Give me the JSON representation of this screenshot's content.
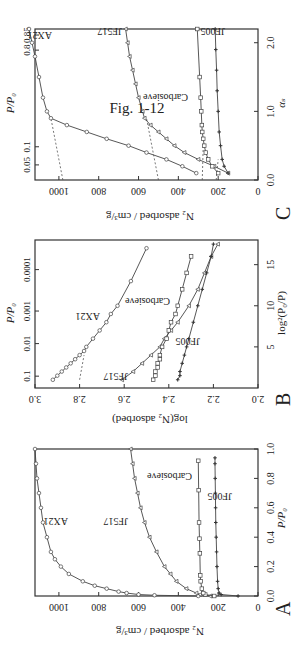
{
  "figure_caption_overlay": "Fig. 1-12",
  "chart_data": [
    {
      "panel": "A",
      "type": "line",
      "title": "",
      "xlabel": "P/P0",
      "ylabel": "N2 adsorbed / cm3/g",
      "xlim": [
        0.0,
        1.0
      ],
      "ylim": [
        0,
        1120
      ],
      "xticks": [
        "0.0",
        "0.2",
        "0.4",
        "0.6",
        "0.8",
        "1.0"
      ],
      "yticks": [
        "0",
        "200",
        "400",
        "600",
        "800",
        "1000"
      ],
      "grid": false,
      "series": [
        {
          "name": "AX21",
          "marker": "circle",
          "x": [
            0.0,
            0.005,
            0.01,
            0.02,
            0.03,
            0.05,
            0.07,
            0.1,
            0.15,
            0.2,
            0.25,
            0.3,
            0.4,
            0.5,
            0.6,
            0.7,
            0.8,
            0.9,
            1.0
          ],
          "y": [
            300,
            520,
            600,
            660,
            700,
            760,
            820,
            880,
            950,
            990,
            1020,
            1040,
            1060,
            1080,
            1090,
            1100,
            1110,
            1115,
            1120
          ]
        },
        {
          "name": "JF517",
          "marker": "triangle",
          "x": [
            0.0,
            0.01,
            0.02,
            0.05,
            0.1,
            0.15,
            0.2,
            0.3,
            0.4,
            0.5,
            0.6,
            0.7,
            0.8,
            0.9,
            1.0
          ],
          "y": [
            240,
            290,
            310,
            360,
            410,
            440,
            470,
            510,
            545,
            570,
            590,
            605,
            620,
            630,
            640
          ]
        },
        {
          "name": "Carbosieve",
          "marker": "square",
          "x": [
            0.0,
            0.01,
            0.02,
            0.05,
            0.1,
            0.14,
            0.29,
            0.39,
            0.5,
            0.72,
            0.92
          ],
          "y": [
            220,
            265,
            275,
            282,
            288,
            290,
            292,
            294,
            296,
            298,
            300
          ]
        },
        {
          "name": "JF005",
          "marker": "plus",
          "x": [
            0.0,
            0.01,
            0.02,
            0.05,
            0.1,
            0.2,
            0.3,
            0.4,
            0.5,
            0.6,
            0.7,
            0.8,
            0.9,
            0.94
          ],
          "y": [
            100,
            185,
            195,
            200,
            203,
            206,
            208,
            210,
            212,
            213,
            214,
            215,
            216,
            216
          ]
        }
      ],
      "labels": [
        "AX21",
        "JF517",
        "Carbosieve",
        "JF005"
      ]
    },
    {
      "panel": "B",
      "type": "line",
      "xlabel": "log2(P0/P)",
      "ylabel": "log(N2 adsorbed)",
      "top_axis_label": "P/P0",
      "top_ticks": [
        "0.1",
        "0.01",
        "0.001",
        "0.0001"
      ],
      "xlim": [
        0,
        18
      ],
      "ylim": [
        2.0,
        3.0
      ],
      "xticks": [
        "5",
        "10",
        "15"
      ],
      "yticks": [
        "2.0",
        "2.2",
        "2.4",
        "2.6",
        "2.8",
        "3.0"
      ],
      "series": [
        {
          "name": "AX21",
          "x": [
            1,
            1.5,
            2,
            2.5,
            3,
            3.5,
            4,
            4.5,
            5,
            6,
            7,
            8,
            9,
            10,
            13,
            17
          ],
          "y": [
            2.92,
            2.9,
            2.88,
            2.86,
            2.84,
            2.82,
            2.8,
            2.78,
            2.77,
            2.74,
            2.71,
            2.68,
            2.66,
            2.63,
            2.57,
            2.5
          ],
          "dashed_extrap": {
            "x": [
              1,
              4
            ],
            "y": [
              2.8,
              2.78
            ]
          }
        },
        {
          "name": "JF517",
          "x": [
            1,
            2,
            3,
            4,
            5,
            6,
            7,
            8,
            10,
            12,
            14,
            16,
            17.5
          ],
          "y": [
            2.61,
            2.56,
            2.52,
            2.48,
            2.44,
            2.42,
            2.39,
            2.36,
            2.31,
            2.27,
            2.24,
            2.21,
            2.18
          ]
        },
        {
          "name": "Carbosieve",
          "x": [
            1,
            1.5,
            2,
            2.5,
            3,
            3.5,
            4,
            5,
            6,
            7,
            8,
            9,
            10,
            12,
            14,
            16
          ],
          "y": [
            2.47,
            2.46,
            2.46,
            2.45,
            2.45,
            2.44,
            2.44,
            2.43,
            2.41,
            2.4,
            2.39,
            2.37,
            2.36,
            2.34,
            2.32,
            2.3
          ]
        },
        {
          "name": "JF005",
          "x": [
            1,
            1.5,
            2,
            3,
            4,
            5,
            6,
            8,
            10,
            12,
            14,
            16,
            17.5
          ],
          "y": [
            2.36,
            2.35,
            2.35,
            2.34,
            2.33,
            2.32,
            2.31,
            2.29,
            2.27,
            2.25,
            2.23,
            2.21,
            2.2
          ]
        }
      ],
      "labels": [
        "AX21",
        "JF517",
        "Carbosieve",
        "JF005"
      ]
    },
    {
      "panel": "C",
      "type": "line",
      "xlabel": "αs",
      "ylabel": "N2 adsorbed / cm3/g",
      "top_axis_label": "P/P0",
      "top_ticks": [
        "0.05",
        "0.1",
        "0.8",
        "0.85"
      ],
      "xlim": [
        0.0,
        2.2
      ],
      "ylim": [
        0,
        1120
      ],
      "xticks": [
        "0.0",
        "1.0",
        "2.0"
      ],
      "yticks": [
        "0",
        "200",
        "400",
        "600",
        "800",
        "1000"
      ],
      "series": [
        {
          "name": "AX21",
          "x": [
            0.1,
            0.2,
            0.3,
            0.4,
            0.5,
            0.6,
            0.7,
            0.8,
            0.9,
            1.0,
            1.2,
            1.5,
            1.8,
            2.0,
            2.2
          ],
          "y": [
            310,
            380,
            460,
            560,
            650,
            760,
            860,
            960,
            1040,
            1060,
            1080,
            1100,
            1120,
            1135,
            1150
          ],
          "dashed_extrap": {
            "x": [
              0.0,
              0.9
            ],
            "y": [
              980,
              1040
            ]
          }
        },
        {
          "name": "JF517",
          "x": [
            0.1,
            0.2,
            0.3,
            0.4,
            0.5,
            0.6,
            0.7,
            0.8,
            0.9,
            1.0,
            1.2,
            1.4,
            1.6,
            1.8,
            2.0,
            2.2
          ],
          "y": [
            150,
            220,
            300,
            370,
            420,
            460,
            500,
            540,
            570,
            580,
            600,
            615,
            630,
            645,
            655,
            665
          ],
          "dashed_extrap": {
            "x": [
              0.0,
              0.9
            ],
            "y": [
              500,
              560
            ]
          }
        },
        {
          "name": "Carbosieve",
          "x": [
            0.1,
            0.2,
            0.3,
            0.4,
            0.5,
            0.6,
            0.7,
            0.8,
            1.0,
            1.2,
            1.5,
            2.2
          ],
          "y": [
            200,
            230,
            250,
            262,
            270,
            275,
            280,
            282,
            285,
            288,
            293,
            305
          ],
          "dashed_extrap": {
            "x": [
              0.0,
              0.5
            ],
            "y": [
              280,
              275
            ]
          }
        },
        {
          "name": "JF005",
          "x": [
            0.1,
            0.2,
            0.3,
            0.5,
            0.7,
            1.0,
            1.3,
            1.6,
            1.9,
            2.2
          ],
          "y": [
            150,
            170,
            180,
            188,
            195,
            200,
            205,
            208,
            212,
            215
          ],
          "dashed_extrap": {
            "x": [
              0.0,
              0.3
            ],
            "y": [
              210,
              200
            ]
          }
        }
      ],
      "labels": [
        "AX21",
        "JF517",
        "Carbosieve",
        "JF005"
      ]
    }
  ],
  "panels": {
    "A": {
      "letter": "A",
      "ylabel": "N₂ adsorbed / cm³/g",
      "xlabel": "P/P₀",
      "xticks": [
        "0.0",
        "0.2",
        "0.4",
        "0.6",
        "0.8",
        "1.0"
      ],
      "yticks": [
        "0",
        "200",
        "400",
        "600",
        "800",
        "1000"
      ],
      "labels": {
        "ax21": "AX21",
        "jf517": "JF517",
        "carbosieve": "Carbosieve",
        "jf005": "JF005"
      }
    },
    "B": {
      "letter": "B",
      "ylabel": "log(N₂ adsorbed)",
      "xlabel": "log²(P₀/P)",
      "toplabel": "P/P₀",
      "topticks": [
        "0.1",
        "0.01",
        "0.001",
        "0.0001"
      ],
      "xticks": [
        "5",
        "10",
        "15"
      ],
      "yticks": [
        "2.0",
        "2.2",
        "2.4",
        "2.6",
        "2.8",
        "3.0"
      ],
      "labels": {
        "ax21": "AX21",
        "jf517": "JF517",
        "carbosieve": "Carbosieve",
        "jf005": "JF005"
      }
    },
    "C": {
      "letter": "C",
      "ylabel": "N₂ adsorbed / cm³/g",
      "xlabel": "αₛ",
      "toplabel": "P/P₀",
      "topticks": [
        "0.05",
        "0.1",
        "0.8",
        "0.85"
      ],
      "xticks": [
        "0.0",
        "1.0",
        "2.0"
      ],
      "yticks": [
        "0",
        "200",
        "400",
        "600",
        "800",
        "1000"
      ],
      "labels": {
        "ax21": "AX21",
        "jf517": "JF517",
        "carbosieve": "Carbosieve",
        "jf005": "JF005"
      }
    }
  }
}
